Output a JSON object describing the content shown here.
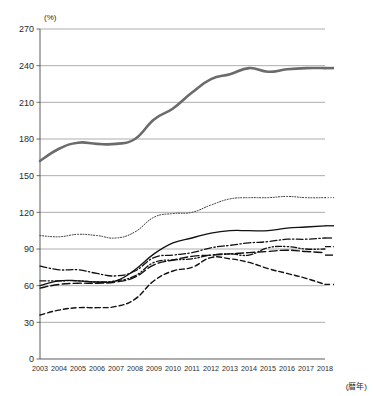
{
  "chart_data": {
    "type": "line",
    "title": "",
    "xlabel": "(暦年)",
    "ylabel": "(%)",
    "ylim": [
      0,
      270
    ],
    "xlim": [
      2003,
      2018
    ],
    "grid": true,
    "legend_position": "right-inline",
    "yticks": [
      "270",
      "240",
      "210",
      "180",
      "150",
      "120",
      "90",
      "60",
      "30",
      "0"
    ],
    "ytick_values": [
      270,
      240,
      210,
      180,
      150,
      120,
      90,
      60,
      30,
      0
    ],
    "categories": [
      "2003",
      "2004",
      "2005",
      "2006",
      "2007",
      "2008",
      "2009",
      "2010",
      "2011",
      "2012",
      "2013",
      "2014",
      "2015",
      "2016",
      "2017",
      "2018"
    ],
    "x": [
      2003,
      2004,
      2005,
      2006,
      2007,
      2008,
      2009,
      2010,
      2011,
      2012,
      2013,
      2014,
      2015,
      2016,
      2017,
      2018
    ],
    "series": [
      {
        "name": "日本",
        "label": "日本",
        "style": "solid-thick",
        "color": "#6b6b6b",
        "values": [
          162,
          172,
          177,
          176,
          176,
          180,
          196,
          205,
          218,
          229,
          233,
          238,
          235,
          237,
          238,
          238
        ]
      },
      {
        "name": "イタリア",
        "label": "イタリア",
        "style": "dotted",
        "color": "#2b2b2b",
        "values": [
          101,
          100,
          102,
          101,
          99,
          104,
          116,
          119,
          120,
          126,
          131,
          132,
          132,
          133,
          132,
          132
        ]
      },
      {
        "name": "米国",
        "label": "米国",
        "style": "solid",
        "color": "#111111",
        "values": [
          60,
          64,
          64,
          63,
          64,
          73,
          86,
          95,
          99,
          103,
          105,
          105,
          105,
          107,
          108,
          109
        ]
      },
      {
        "name": "フランス",
        "label": "フランス",
        "style": "dash-dot",
        "color": "#111111",
        "values": [
          76,
          73,
          73,
          70,
          68,
          72,
          83,
          85,
          87,
          91,
          93,
          95,
          96,
          98,
          98,
          99
        ]
      },
      {
        "name": "カナダ",
        "label": "カナダ",
        "style": "dash-dot-dot",
        "color": "#111111",
        "values": [
          64,
          64,
          64,
          63,
          64,
          68,
          79,
          81,
          82,
          85,
          86,
          85,
          91,
          92,
          90,
          90
        ]
      },
      {
        "name": "英国",
        "label": "英国",
        "style": "long-dash",
        "color": "#111111",
        "values": [
          58,
          61,
          62,
          62,
          63,
          67,
          77,
          81,
          84,
          85,
          86,
          87,
          88,
          89,
          88,
          87
        ]
      },
      {
        "name": "ドイツ",
        "label": "ドイツ",
        "style": "dashed",
        "color": "#111111",
        "values": [
          36,
          40,
          42,
          42,
          43,
          49,
          64,
          72,
          75,
          83,
          82,
          79,
          74,
          70,
          66,
          61
        ]
      }
    ],
    "labels_right": [
      {
        "name": "日本",
        "y_value": 238
      },
      {
        "name": "イタリア",
        "y_value": 132
      },
      {
        "name": "米国",
        "y_value": 109
      },
      {
        "name": "フランス",
        "y_value": 99
      },
      {
        "name": "カナダ",
        "y_value": 92
      },
      {
        "name": "英国",
        "y_value": 85
      },
      {
        "name": "ドイツ",
        "y_value": 61
      }
    ]
  }
}
